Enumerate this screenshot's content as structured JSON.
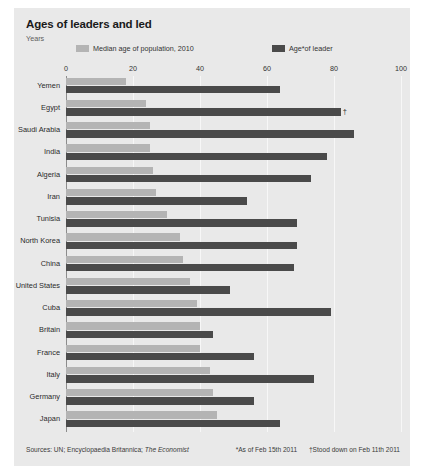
{
  "title": "Ages of leaders and led",
  "unit_label": "Years",
  "legend": {
    "median": {
      "label": "Median age of population, 2010",
      "color": "#b4b4b4"
    },
    "leader": {
      "label": "Age*of leader",
      "color": "#4a4a4a"
    }
  },
  "footer": {
    "sources_prefix": "Sources: UN; Encyclopaedia Britannica;",
    "sources_italic": "The Economist",
    "note_1": "*As of Feb 15th 2011",
    "note_2": "†Stood down on Feb 11th 2011"
  },
  "chart_data": {
    "type": "bar",
    "orientation": "horizontal",
    "title": "Ages of leaders and led",
    "xlabel": "Years",
    "ylabel": "",
    "xlim": [
      0,
      100
    ],
    "xticks": [
      0,
      20,
      40,
      60,
      80,
      100
    ],
    "grid": true,
    "legend_position": "top",
    "categories": [
      "Yemen",
      "Egypt",
      "Saudi Arabia",
      "India",
      "Algeria",
      "Iran",
      "Tunisia",
      "North Korea",
      "China",
      "United States",
      "Cuba",
      "Britain",
      "France",
      "Italy",
      "Germany",
      "Japan"
    ],
    "series": [
      {
        "name": "Median age of population, 2010",
        "color": "#b4b4b4",
        "values": [
          18,
          24,
          25,
          25,
          26,
          27,
          30,
          34,
          35,
          37,
          39,
          40,
          40,
          43,
          44,
          45
        ]
      },
      {
        "name": "Age*of leader",
        "color": "#4a4a4a",
        "values": [
          64,
          82,
          86,
          78,
          73,
          54,
          69,
          69,
          68,
          49,
          79,
          44,
          56,
          74,
          56,
          64
        ]
      }
    ],
    "annotations": [
      {
        "category": "Egypt",
        "series": "Age*of leader",
        "marker": "†"
      }
    ]
  }
}
